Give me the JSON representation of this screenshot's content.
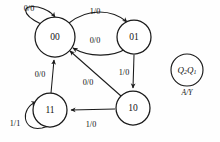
{
  "diagram": {
    "type": "mealy-state-transition-diagram",
    "background_color": "#fefefe",
    "stroke_color": "#1a1a1a",
    "states": [
      {
        "id": "s00",
        "label": "00",
        "cx": 55,
        "cy": 37,
        "r": 20
      },
      {
        "id": "s01",
        "label": "01",
        "cx": 134,
        "cy": 37,
        "r": 17
      },
      {
        "id": "s10",
        "label": "10",
        "cx": 133,
        "cy": 108,
        "r": 17
      },
      {
        "id": "s11",
        "label": "11",
        "cx": 50,
        "cy": 110,
        "r": 17
      }
    ],
    "transitions": [
      {
        "id": "t00-self",
        "from": "00",
        "to": "00",
        "label": "0/0",
        "label_x": 29,
        "label_y": 9
      },
      {
        "id": "t00-01",
        "from": "00",
        "to": "01",
        "label": "1/0",
        "label_x": 95,
        "label_y": 12
      },
      {
        "id": "t01-00",
        "from": "01",
        "to": "00",
        "label": "0/0",
        "label_x": 95,
        "label_y": 41
      },
      {
        "id": "t01-10",
        "from": "01",
        "to": "10",
        "label": "1/0",
        "label_x": 124,
        "label_y": 73
      },
      {
        "id": "t10-11",
        "from": "10",
        "to": "11",
        "label": "1/0",
        "label_x": 91,
        "label_y": 125
      },
      {
        "id": "t10-00",
        "from": "10",
        "to": "00",
        "label": "0/0",
        "label_x": 88,
        "label_y": 83
      },
      {
        "id": "t11-00",
        "from": "11",
        "to": "00",
        "label": "0/0",
        "label_x": 40,
        "label_y": 75
      },
      {
        "id": "t11-self",
        "from": "11",
        "to": "11",
        "label": "1/1",
        "label_x": 15,
        "label_y": 124
      }
    ],
    "legend": {
      "state_var_main": "Q",
      "state_var_sub_high": "2",
      "state_var_sub_low": "1",
      "io_label": "A/Y",
      "cx": 187,
      "cy": 70,
      "r": 16,
      "io_y": 93
    }
  }
}
